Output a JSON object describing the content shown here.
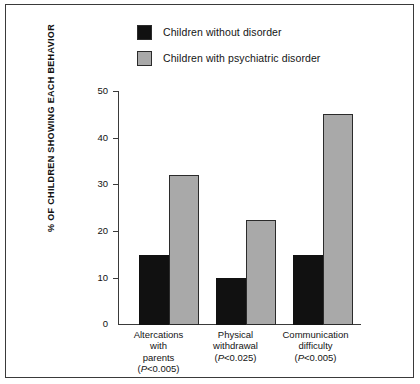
{
  "chart_data": {
    "type": "bar",
    "title": "",
    "xlabel": "",
    "ylabel": "% OF CHILDREN SHOWING EACH BEHAVIOR",
    "ylim": [
      0,
      50
    ],
    "yticks": [
      0,
      10,
      20,
      30,
      40,
      50
    ],
    "grid": false,
    "legend_position": "top",
    "categories": [
      "Altercations with parents",
      "Physical withdrawal",
      "Communication difficulty"
    ],
    "category_lines": [
      [
        "Altercations",
        "with",
        "parents"
      ],
      [
        "Physical",
        "withdrawal"
      ],
      [
        "Communication",
        "difficulty"
      ]
    ],
    "annotations": [
      {
        "category": "Altercations with parents",
        "text": "(P<0.005)"
      },
      {
        "category": "Physical withdrawal",
        "text": "(P<0.025)"
      },
      {
        "category": "Communication difficulty",
        "text": "(P<0.005)"
      }
    ],
    "series": [
      {
        "name": "Children without disorder",
        "color": "#111111",
        "values": [
          15,
          10,
          15
        ]
      },
      {
        "name": "Children with psychiatric disorder",
        "color": "#a9a9a9",
        "values": [
          32,
          22.5,
          45
        ]
      }
    ]
  },
  "legend": {
    "items": [
      {
        "label": "Children without disorder",
        "swatch": "dark"
      },
      {
        "label": "Children with psychiatric disorder",
        "swatch": "gray"
      }
    ]
  },
  "axis": {
    "tick_labels": [
      "50",
      "40",
      "30",
      "20",
      "10",
      "0"
    ]
  }
}
